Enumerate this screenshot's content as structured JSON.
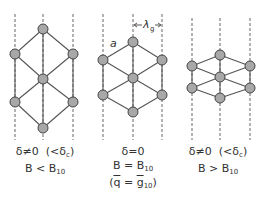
{
  "panels": [
    {
      "id": "left",
      "condition": "δ≠0",
      "condition_note": "(<δ",
      "condition_note_sub": "c",
      "condition_note_end": ")",
      "relation": "B < B",
      "relation_sub": "10",
      "nodes": [
        [
          43,
          29
        ],
        [
          15,
          54
        ],
        [
          73,
          54
        ],
        [
          43,
          79
        ],
        [
          15,
          102
        ],
        [
          73,
          102
        ],
        [
          43,
          128
        ]
      ],
      "dashed_x": [
        15,
        43,
        73
      ]
    },
    {
      "id": "middle",
      "condition": "δ=0",
      "relation": "B = B",
      "relation_sub": "10",
      "extra_open": "(",
      "extra_q": "q",
      "extra_eq": " = ",
      "extra_g": "g",
      "extra_sub": "10",
      "extra_close": ")",
      "nodes": [
        [
          133,
          42
        ],
        [
          103,
          60
        ],
        [
          162,
          60
        ],
        [
          133,
          78
        ],
        [
          103,
          95
        ],
        [
          162,
          95
        ],
        [
          133,
          112
        ]
      ],
      "dashed_x": [
        103,
        133,
        162
      ],
      "lattice_label": "a",
      "spacing_label": "λ",
      "spacing_sub": "g"
    },
    {
      "id": "right",
      "condition": "δ≠0",
      "condition_note": "(<δ",
      "condition_note_sub": "c",
      "condition_note_end": ")",
      "relation": "B > B",
      "relation_sub": "10",
      "nodes": [
        [
          220,
          55
        ],
        [
          192,
          66
        ],
        [
          250,
          66
        ],
        [
          220,
          77
        ],
        [
          192,
          88
        ],
        [
          250,
          88
        ],
        [
          220,
          98
        ]
      ],
      "dashed_x": [
        192,
        220,
        250
      ]
    }
  ],
  "colors": {
    "line": "#555555",
    "node_fill": "#a8a8a8",
    "node_stroke": "#444444"
  }
}
